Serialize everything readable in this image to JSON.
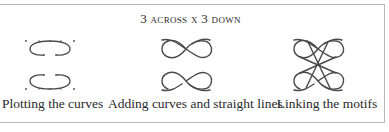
{
  "figure": {
    "title": "3 across x 3 down",
    "panels": [
      {
        "caption": "Plotting the curves",
        "icon": "plotted-curves-motif-icon"
      },
      {
        "caption": "Adding curves and straight lines",
        "icon": "figure-eight-motif-icon"
      },
      {
        "caption": "Linking the motifs",
        "icon": "linked-knot-motif-icon"
      }
    ],
    "colors": {
      "stroke": "#4a4a4a",
      "border": "#b8b8b8",
      "text": "#2a2a2a"
    }
  }
}
